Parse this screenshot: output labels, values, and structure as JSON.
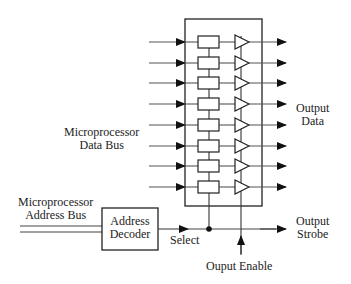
{
  "diagram": {
    "labels": {
      "data_bus": [
        "Microprocessor",
        "Data Bus"
      ],
      "address_bus": [
        "Microprocessor",
        "Address Bus"
      ],
      "decoder": [
        "Address",
        "Decoder"
      ],
      "select": "Select",
      "output_data": [
        "Output",
        "Data"
      ],
      "output_strobe": [
        "Output",
        "Strobe"
      ],
      "output_enable": "Ouput Enable"
    },
    "bit_count": 8,
    "row_y": [
      42,
      63,
      83,
      104,
      125,
      146,
      166,
      187
    ],
    "colors": {
      "line": "#222222",
      "wire": "#555555",
      "background": "#ffffff"
    }
  }
}
